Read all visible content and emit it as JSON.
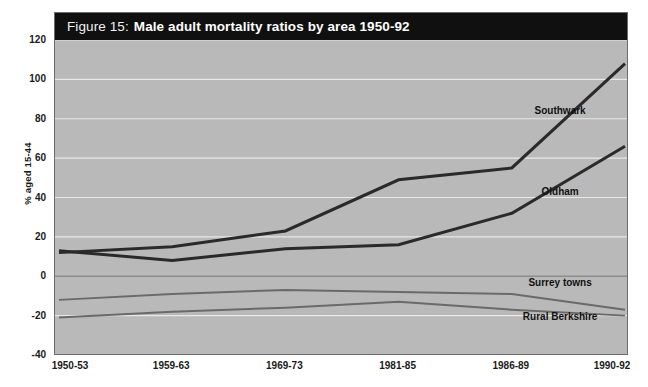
{
  "figure": {
    "title_prefix": "Figure 15:",
    "title_main": "Male adult mortality ratios by area 1950-92",
    "background_color": "#b9b9b9",
    "title_band_color": "#101010",
    "page_color": "#ffffff"
  },
  "chart_data": {
    "type": "line",
    "title": "Figure 15: Male adult mortality ratios by area 1950-92",
    "xlabel": "",
    "ylabel": "% aged 15-44",
    "categories": [
      "1950-53",
      "1959-63",
      "1969-73",
      "1981-85",
      "1986-89",
      "1990-92"
    ],
    "ylim": [
      -40,
      120
    ],
    "yticks": [
      -40,
      -20,
      0,
      20,
      40,
      60,
      80,
      100,
      120
    ],
    "ytick_labels": [
      "-40",
      "-20",
      "0",
      "20",
      "40",
      "60",
      "80",
      "100",
      "120"
    ],
    "grid": true,
    "grid_color": "#e8e8e8",
    "legend": "inline-labels",
    "series": [
      {
        "name": "Southwark",
        "color": "#2a2a2a",
        "width": 3,
        "values": [
          12,
          15,
          23,
          49,
          55,
          108
        ],
        "label_x_pct": 88.0,
        "label_y_pct": 28.4
      },
      {
        "name": "Oldham",
        "color": "#2a2a2a",
        "width": 3,
        "values": [
          13,
          8,
          14,
          16,
          32,
          66
        ],
        "label_x_pct": 88.0,
        "label_y_pct": 52.0
      },
      {
        "name": "Surrey towns",
        "color": "#6a6a6a",
        "width": 2,
        "values": [
          -12,
          -9,
          -7,
          -8,
          -9,
          -17
        ],
        "label_x_pct": 88.0,
        "label_y_pct": 78.5
      },
      {
        "name": "Rural Berkshire",
        "color": "#6a6a6a",
        "width": 2,
        "values": [
          -21,
          -18,
          -16,
          -13,
          -17,
          -20
        ],
        "label_x_pct": 88.0,
        "label_y_pct": 88.2
      }
    ],
    "zero_line": {
      "value": 0,
      "color": "#8c8c8c"
    }
  }
}
